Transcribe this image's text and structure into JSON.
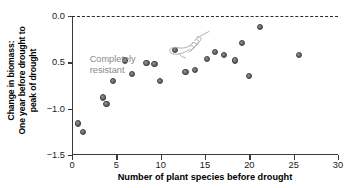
{
  "chart_data": {
    "type": "scatter",
    "title": "",
    "xlabel": "Number of plant species before drought",
    "ylabel": "Change in biomass:\nOne year before drought to\npeak of drought",
    "ylabel_lines": [
      "Change in biomass:",
      "One year before drought to",
      "peak of drought"
    ],
    "xlim": [
      0,
      30
    ],
    "ylim": [
      -1.5,
      0.0
    ],
    "xticks": [
      0,
      5,
      10,
      15,
      20,
      25,
      30
    ],
    "yticks": [
      0.0,
      -0.5,
      -1.0,
      -1.5
    ],
    "xtick_labels": [
      "0",
      "5",
      "10",
      "15",
      "20",
      "25",
      "30"
    ],
    "ytick_labels": [
      "0.0",
      "0.5",
      "−1.0",
      "−1.5"
    ],
    "grid": false,
    "legend": null,
    "reference_lines": [
      {
        "axis": "y",
        "value": 0.0,
        "style": "dashed",
        "color": "#2b2b2b"
      }
    ],
    "annotations": [
      {
        "text_lines": [
          "Completely",
          "resistant"
        ],
        "x": 2.0,
        "y": -0.52,
        "color": "#8a8a8a",
        "icon": "pointing-hand-icon"
      }
    ],
    "marker": {
      "shape": "circle",
      "color": "#6e6e6e",
      "edge_color": "#3d3d3d",
      "size": 6.2
    },
    "points": [
      {
        "x": 0.7,
        "y": -1.16
      },
      {
        "x": 1.2,
        "y": -1.25
      },
      {
        "x": 3.5,
        "y": -0.88
      },
      {
        "x": 3.9,
        "y": -0.95
      },
      {
        "x": 4.6,
        "y": -0.7
      },
      {
        "x": 6.0,
        "y": -0.48
      },
      {
        "x": 6.8,
        "y": -0.63
      },
      {
        "x": 8.4,
        "y": -0.51
      },
      {
        "x": 9.3,
        "y": -0.52
      },
      {
        "x": 9.9,
        "y": -0.7
      },
      {
        "x": 11.6,
        "y": -0.37
      },
      {
        "x": 12.8,
        "y": -0.6
      },
      {
        "x": 13.9,
        "y": -0.58
      },
      {
        "x": 15.2,
        "y": -0.46
      },
      {
        "x": 16.1,
        "y": -0.39
      },
      {
        "x": 17.1,
        "y": -0.42
      },
      {
        "x": 18.4,
        "y": -0.48
      },
      {
        "x": 19.2,
        "y": -0.29
      },
      {
        "x": 20.0,
        "y": -0.65
      },
      {
        "x": 21.2,
        "y": -0.12
      },
      {
        "x": 25.6,
        "y": -0.42
      }
    ]
  }
}
